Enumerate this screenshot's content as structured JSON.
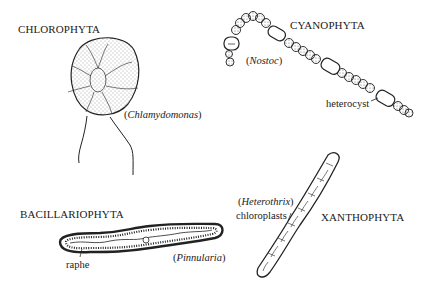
{
  "groups": [
    {
      "name": "CHLOROPHYTA",
      "genus": "Chlamydomonas",
      "labels": []
    },
    {
      "name": "CYANOPHYTA",
      "genus": "Nostoc",
      "labels": [
        "heterocyst"
      ]
    },
    {
      "name": "BACILLARIOPHYTA",
      "genus": "Pinnularia",
      "labels": [
        "raphe"
      ]
    },
    {
      "name": "XANTHOPHYTA",
      "genus": "Heterothrix",
      "labels": [
        "chloroplasts"
      ]
    }
  ],
  "colors": {
    "ink": "#222222",
    "background": "#ffffff"
  }
}
